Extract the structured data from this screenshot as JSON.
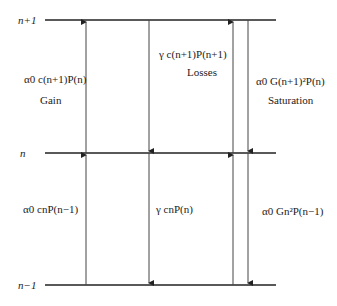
{
  "levels": {
    "top": "n+1",
    "middle": "n",
    "bottom": "n−1"
  },
  "upper_transitions": {
    "gain_formula": "α0 c(n+1)P(n)",
    "gain_name": "Gain",
    "losses_formula": "γ c(n+1)P(n+1)",
    "losses_name": "Losses",
    "saturation_formula": "α0 G(n+1)²P(n)",
    "saturation_name": "Saturation"
  },
  "lower_transitions": {
    "gain_formula": "α0 cnP(n−1)",
    "losses_formula": "γ cnP(n)",
    "saturation_formula": "α0 Gn²P(n−1)"
  },
  "colors": {
    "line": "#222222",
    "arrow": "#444444"
  }
}
